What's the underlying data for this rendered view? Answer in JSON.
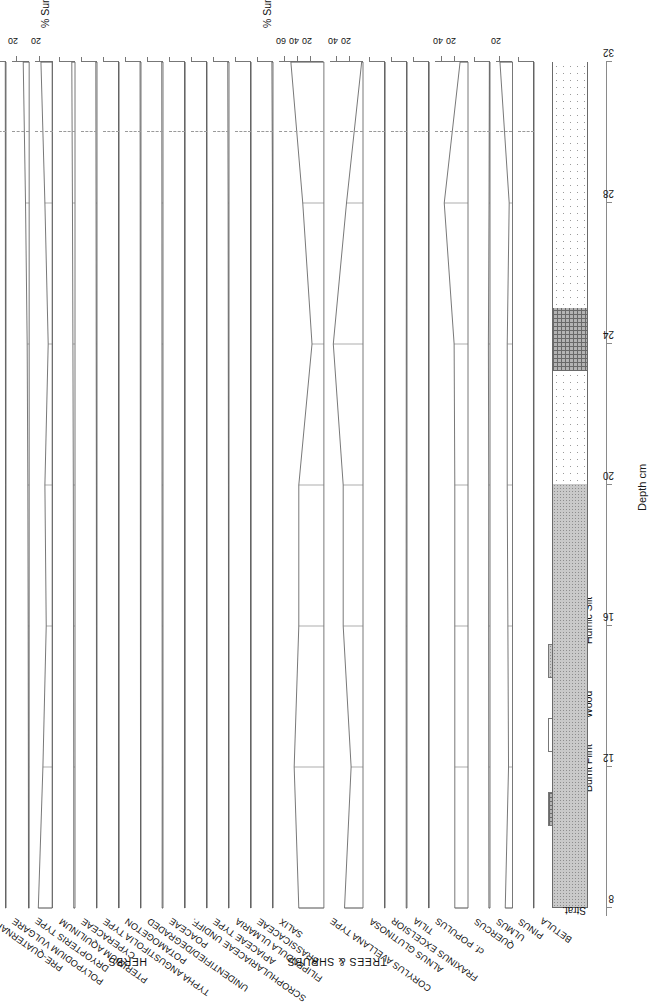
{
  "figure": {
    "kind": "pollen-percentage-diagram",
    "site_code": "BC04",
    "depth_axis_title": "Depth cm",
    "strat_label": "Strat.",
    "zone_header": "Zone"
  },
  "axes": {
    "depth": {
      "label": "Depth cm",
      "min": 8,
      "max": 32,
      "ticks": [
        8,
        12,
        16,
        20,
        24,
        28,
        32
      ],
      "unit": "cm"
    },
    "unit_labels": [
      "% Sum",
      "% Sum+Spores"
    ]
  },
  "zones": [
    {
      "name": "BC04: 2",
      "depth_from": 8,
      "depth_to": 30
    },
    {
      "name": "BC04: 1",
      "depth_from": 30,
      "depth_to": 32
    }
  ],
  "groups": [
    {
      "label": "TREES & SHRUBS"
    },
    {
      "label": "HERBS"
    },
    {
      "label": "MARSH SPORES"
    },
    {
      "label": "TOTALS"
    }
  ],
  "legend": {
    "title": "",
    "items": [
      {
        "label": "Humic Silt",
        "pattern": "humic"
      },
      {
        "label": "Wood",
        "pattern": "wood"
      },
      {
        "label": "Burnt Flint",
        "pattern": "flint"
      }
    ]
  },
  "stratigraphy": [
    {
      "lithology": "Humic Silt",
      "from": 8,
      "to": 20,
      "pattern": "humic"
    },
    {
      "lithology": "Wood",
      "from": 20,
      "to": 23.2,
      "pattern": "wood"
    },
    {
      "lithology": "Burnt Flint",
      "from": 23.2,
      "to": 25,
      "pattern": "flint"
    },
    {
      "lithology": "Wood",
      "from": 25,
      "to": 32,
      "pattern": "wood"
    }
  ],
  "chart_data": {
    "type": "area",
    "xlabel": "Depth cm",
    "ylabel": "",
    "x": [
      8,
      12,
      16,
      20,
      24,
      28,
      32
    ],
    "grid": false,
    "legend_position": "bottom-right",
    "series": [
      {
        "name": "BETULA",
        "group": "TREES & SHRUBS",
        "unit": "% Sum",
        "xmax": 20,
        "ticks": [],
        "values": [
          0.6,
          0.5,
          0.5,
          0.6,
          0.7,
          0.6,
          0.5
        ]
      },
      {
        "name": "PINUS",
        "group": "TREES & SHRUBS",
        "unit": "% Sum",
        "xmax": 25,
        "ticks": [
          20
        ],
        "values": [
          11,
          6,
          7,
          8,
          8,
          5,
          19
        ]
      },
      {
        "name": "ULMUS",
        "group": "TREES & SHRUBS",
        "unit": "% Sum",
        "xmax": 20,
        "ticks": [],
        "values": [
          1.4,
          1.6,
          1.7,
          1.6,
          2.0,
          1.2,
          0.8
        ]
      },
      {
        "name": "QUERCUS",
        "group": "TREES & SHRUBS",
        "unit": "% Sum",
        "xmax": 50,
        "ticks": [
          20,
          40
        ],
        "values": [
          20,
          20,
          20,
          20,
          21,
          36,
          12
        ]
      },
      {
        "name": "cf. POPULUS",
        "group": "TREES & SHRUBS",
        "unit": "% Sum",
        "xmax": 20,
        "ticks": [],
        "values": [
          0.2,
          0.2,
          0.2,
          0.3,
          0.4,
          0.3,
          0.2
        ]
      },
      {
        "name": "TILIA",
        "group": "TREES & SHRUBS",
        "unit": "% Sum",
        "xmax": 20,
        "ticks": [],
        "values": [
          1.0,
          1.0,
          1.1,
          1.0,
          0.9,
          0.7,
          0.4
        ]
      },
      {
        "name": "FRAXINUS EXCELSIOR",
        "group": "TREES & SHRUBS",
        "unit": "% Sum",
        "xmax": 20,
        "ticks": [],
        "values": [
          0.5,
          0.4,
          0.4,
          0.5,
          0.6,
          0.5,
          0.3
        ]
      },
      {
        "name": "ALNUS GLUTINOSA",
        "group": "TREES & SHRUBS",
        "unit": "% Sum",
        "xmax": 50,
        "ticks": [
          20,
          40
        ],
        "values": [
          28,
          18,
          30,
          30,
          45,
          25,
          2
        ]
      },
      {
        "name": "CORYLUS AVELLANA TYPE",
        "group": "TREES & SHRUBS",
        "unit": "% Sum",
        "xmax": 68,
        "ticks": [
          20,
          40,
          60
        ],
        "values": [
          38,
          45,
          38,
          38,
          18,
          32,
          50
        ]
      },
      {
        "name": "SALIX",
        "group": "TREES & SHRUBS",
        "unit": "% Sum",
        "xmax": 20,
        "ticks": [],
        "values": [
          0.4,
          0.4,
          0.4,
          0.5,
          0.5,
          0.6,
          1.4
        ]
      },
      {
        "name": "BRASSICACEAE",
        "group": "HERBS",
        "unit": "% Sum",
        "xmax": 20,
        "ticks": [],
        "values": [
          0.2,
          0.2,
          0.2,
          0.2,
          0.3,
          0.3,
          0.4
        ]
      },
      {
        "name": "FILIPENDULA ULMARIA",
        "group": "HERBS",
        "unit": "% Sum",
        "xmax": 20,
        "ticks": [],
        "values": [
          0.5,
          0.5,
          0.6,
          0.7,
          0.9,
          1.1,
          1.6
        ]
      },
      {
        "name": "APIACEAE TYPE",
        "group": "HERBS",
        "unit": "% Sum",
        "xmax": 20,
        "ticks": [],
        "values": [
          0.3,
          0.3,
          0.3,
          0.4,
          0.4,
          0.5,
          0.6
        ]
      },
      {
        "name": "SCROPHULARIACEAE UNDIFF.",
        "group": "HERBS",
        "unit": "% Sum",
        "xmax": 20,
        "ticks": [],
        "values": [
          0.2,
          0.2,
          0.2,
          0.2,
          0.2,
          0.2,
          0.3
        ]
      },
      {
        "name": "POACEAE",
        "group": "HERBS",
        "unit": "% Sum",
        "xmax": 20,
        "ticks": [],
        "values": [
          1.1,
          1.0,
          1.1,
          1.2,
          1.3,
          1.4,
          1.6
        ]
      },
      {
        "name": "UNIDENTIFIED/DEGRADED",
        "group": "HERBS",
        "unit": "% Sum",
        "xmax": 20,
        "ticks": [],
        "values": [
          0.6,
          0.6,
          0.7,
          0.8,
          0.9,
          1.0,
          1.2
        ]
      },
      {
        "name": "POTAMOGETON",
        "group": "HERBS",
        "unit": "% Sum+Spores",
        "xmax": 20,
        "ticks": [],
        "values": [
          0.2,
          0.2,
          0.3,
          0.3,
          0.4,
          0.4,
          0.5
        ]
      },
      {
        "name": "TYPHA ANGUSTIFOLIA TYPE",
        "group": "HERBS",
        "unit": "% Sum+Spores",
        "xmax": 20,
        "ticks": [],
        "values": [
          0.6,
          0.6,
          0.7,
          0.8,
          1.0,
          1.2,
          1.5
        ]
      },
      {
        "name": "CYPERACEAE",
        "group": "HERBS",
        "unit": "% Sum+Spores",
        "xmax": 20,
        "ticks": [],
        "values": [
          1.6,
          1.6,
          1.8,
          2.1,
          2.6,
          3.2,
          4.0
        ]
      },
      {
        "name": "PTERIDIUM AQUILINUM",
        "group": "MARSH SPORES",
        "unit": "% Sum+Spores",
        "xmax": 26,
        "ticks": [
          20
        ],
        "values": [
          21,
          14,
          9,
          11,
          6,
          11,
          17
        ]
      },
      {
        "name": "DRYOPTERIS TYPE",
        "group": "MARSH SPORES",
        "unit": "% Sum+Spores",
        "xmax": 26,
        "ticks": [
          20
        ],
        "values": [
          1.0,
          1.2,
          1.5,
          2.0,
          3.0,
          5.5,
          9.0
        ]
      },
      {
        "name": "POLYPODIUM VULGARE",
        "group": "MARSH SPORES",
        "unit": "% Sum+Spores",
        "xmax": 20,
        "ticks": [],
        "values": [
          0.5,
          0.5,
          0.6,
          0.6,
          0.7,
          0.8,
          0.9
        ]
      },
      {
        "name": "PRE-QUATERNARY",
        "group": "MARSH SPORES",
        "unit": "% Sum+Spores",
        "xmax": 170,
        "ticks": [
          50,
          100,
          150
        ],
        "values": [
          84,
          77,
          82,
          88,
          85,
          74,
          57
        ]
      },
      {
        "name": "TREES/SHRUBS/HERBS",
        "group": "TOTALS",
        "unit": "% Sum+Spores",
        "xmax": 170,
        "ticks": [
          50,
          100,
          150
        ],
        "values": [
          96,
          95,
          96,
          97,
          96,
          93,
          88
        ]
      },
      {
        "name": "MARSH SPORES",
        "group": "TOTALS",
        "unit": "% Sum+Spores",
        "xmax": 26,
        "ticks": [
          20
        ],
        "values": [
          23,
          18,
          15,
          17,
          12,
          10,
          14
        ]
      },
      {
        "name": "MISC.",
        "group": "TOTALS",
        "unit": "% Sum+Spores",
        "xmax": 26,
        "ticks": [
          20
        ],
        "values": [
          0.3,
          0.3,
          0.3,
          0.4,
          0.5,
          8,
          21
        ]
      }
    ]
  }
}
